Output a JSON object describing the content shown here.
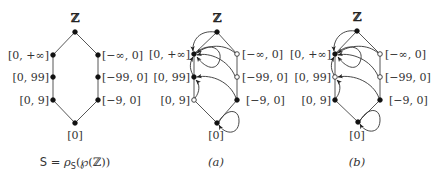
{
  "figure": {
    "diagrams": [
      {
        "id": "S",
        "caption": "S = ρS(℘(ℤ))",
        "caption_parts": {
          "lhs": "S",
          "eq": " = ρ",
          "sub": "S",
          "rest": "(℘(ℤ))"
        },
        "top_label": "ℤ",
        "bottom_label": "[0]",
        "left_labels": [
          "[0, +∞]",
          "[0, 99]",
          "[0, 9]"
        ],
        "right_labels": [
          "[−∞, 0]",
          "[−99, 0]",
          "[−9, 0]"
        ],
        "node_states": {
          "top": "filled",
          "bottom": "filled",
          "left": [
            "filled",
            "filled",
            "filled"
          ],
          "right": [
            "filled",
            "filled",
            "filled"
          ]
        },
        "arrows": []
      },
      {
        "id": "a",
        "caption": "(a)",
        "top_label": "ℤ",
        "bottom_label": "[0]",
        "left_labels": [
          "[0, +∞]",
          "[0, 99]",
          "[0, 9]"
        ],
        "right_labels": [
          "[−∞, 0]",
          "[−99, 0]",
          "[−9, 0]"
        ],
        "node_states": {
          "top": "filled",
          "bottom": "filled",
          "left": [
            "filled",
            "filled",
            "hollow"
          ],
          "right": [
            "hollow",
            "hollow",
            "filled"
          ]
        },
        "arrows": [
          {
            "from": "ℤ",
            "to": "[0, +∞]"
          },
          {
            "from": "[0, +∞]",
            "to": "[0, +∞]",
            "type": "self-loop"
          },
          {
            "from": "[−∞, 0]",
            "to": "[0, +∞]"
          },
          {
            "from": "[−99, 0]",
            "to": "[0, +∞]"
          },
          {
            "from": "[0, 99]",
            "to": "[0, +∞]"
          },
          {
            "from": "[−9, 0]",
            "to": "[0, 99]"
          },
          {
            "from": "[0, 9]",
            "to": "[0, 99]"
          },
          {
            "from": "[0]",
            "to": "[0]",
            "type": "self-loop"
          }
        ]
      },
      {
        "id": "b",
        "caption": "(b)",
        "top_label": "ℤ",
        "bottom_label": "[0]",
        "left_labels": [
          "[0, +∞]",
          "[0, 99]",
          "[0, 9]"
        ],
        "right_labels": [
          "[−∞, 0]",
          "[−99, 0]",
          "[−9, 0]"
        ],
        "node_states": {
          "top": "filled",
          "bottom": "filled",
          "left": [
            "filled",
            "hollow",
            "filled"
          ],
          "right": [
            "hollow",
            "hollow",
            "filled"
          ]
        },
        "arrows": [
          {
            "from": "ℤ",
            "to": "[0, +∞]"
          },
          {
            "from": "[0, +∞]",
            "to": "[0, +∞]",
            "type": "self-loop"
          },
          {
            "from": "[−∞, 0]",
            "to": "[0, +∞]"
          },
          {
            "from": "[−99, 0]",
            "to": "[0, +∞]"
          },
          {
            "from": "[0, 99]",
            "to": "[0, +∞]"
          },
          {
            "from": "[−9, 0]",
            "to": "[0, 99]"
          },
          {
            "from": "[0, 9]",
            "to": "[0, 99]"
          },
          {
            "from": "[0]",
            "to": "[0]",
            "type": "self-loop"
          }
        ]
      }
    ]
  }
}
